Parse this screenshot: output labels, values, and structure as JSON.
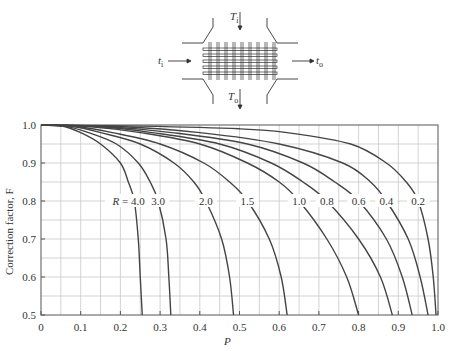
{
  "diagram": {
    "hot_in_label": "T",
    "hot_in_sub": "i",
    "hot_out_label": "T",
    "hot_out_sub": "o",
    "cold_in_label": "t",
    "cold_in_sub": "i",
    "cold_out_label": "t",
    "cold_out_sub": "o"
  },
  "chart_data": {
    "type": "line",
    "title": "",
    "xlabel": "P",
    "ylabel": "Correction factor, F",
    "xlim": [
      0,
      1.0
    ],
    "ylim": [
      0.5,
      1.0
    ],
    "x_ticks": [
      "0",
      "0.1",
      "0.2",
      "0.3",
      "0.4",
      "0.5",
      "0.6",
      "0.7",
      "0.8",
      "0.9",
      "1.0"
    ],
    "y_ticks": [
      "0.5",
      "0.6",
      "0.7",
      "0.8",
      "0.9",
      "1.0"
    ],
    "grid": true,
    "grid_step": 0.05,
    "label_row_F": 0.8,
    "label_prefix": "R = ",
    "series": [
      {
        "name": "4.0",
        "label_x": 0.235,
        "points": [
          [
            0,
            1.0
          ],
          [
            0.05,
            0.998
          ],
          [
            0.1,
            0.98
          ],
          [
            0.15,
            0.95
          ],
          [
            0.2,
            0.9
          ],
          [
            0.22,
            0.85
          ],
          [
            0.235,
            0.8
          ],
          [
            0.245,
            0.7
          ],
          [
            0.25,
            0.6
          ],
          [
            0.255,
            0.5
          ]
        ]
      },
      {
        "name": "3.0",
        "label_x": 0.295,
        "points": [
          [
            0,
            1.0
          ],
          [
            0.06,
            0.997
          ],
          [
            0.12,
            0.98
          ],
          [
            0.19,
            0.95
          ],
          [
            0.245,
            0.9
          ],
          [
            0.275,
            0.85
          ],
          [
            0.295,
            0.8
          ],
          [
            0.315,
            0.7
          ],
          [
            0.322,
            0.6
          ],
          [
            0.327,
            0.5
          ]
        ]
      },
      {
        "name": "2.0",
        "label_x": 0.415,
        "points": [
          [
            0,
            1.0
          ],
          [
            0.08,
            0.996
          ],
          [
            0.15,
            0.98
          ],
          [
            0.25,
            0.95
          ],
          [
            0.335,
            0.9
          ],
          [
            0.385,
            0.85
          ],
          [
            0.415,
            0.8
          ],
          [
            0.455,
            0.7
          ],
          [
            0.475,
            0.6
          ],
          [
            0.485,
            0.5
          ]
        ]
      },
      {
        "name": "1.5",
        "label_x": 0.52,
        "points": [
          [
            0,
            1.0
          ],
          [
            0.09,
            0.996
          ],
          [
            0.18,
            0.98
          ],
          [
            0.3,
            0.95
          ],
          [
            0.41,
            0.9
          ],
          [
            0.475,
            0.85
          ],
          [
            0.52,
            0.8
          ],
          [
            0.575,
            0.7
          ],
          [
            0.605,
            0.6
          ],
          [
            0.62,
            0.5
          ]
        ]
      },
      {
        "name": "1.0",
        "label_x": 0.65,
        "points": [
          [
            0,
            1.0
          ],
          [
            0.12,
            0.996
          ],
          [
            0.25,
            0.98
          ],
          [
            0.4,
            0.95
          ],
          [
            0.52,
            0.9
          ],
          [
            0.6,
            0.85
          ],
          [
            0.65,
            0.8
          ],
          [
            0.72,
            0.7
          ],
          [
            0.77,
            0.6
          ],
          [
            0.8,
            0.5
          ]
        ]
      },
      {
        "name": "0.8",
        "label_x": 0.72,
        "points": [
          [
            0,
            1.0
          ],
          [
            0.14,
            0.996
          ],
          [
            0.28,
            0.98
          ],
          [
            0.45,
            0.95
          ],
          [
            0.58,
            0.9
          ],
          [
            0.66,
            0.85
          ],
          [
            0.72,
            0.8
          ],
          [
            0.8,
            0.7
          ],
          [
            0.855,
            0.6
          ],
          [
            0.885,
            0.5
          ]
        ]
      },
      {
        "name": "0.6",
        "label_x": 0.8,
        "points": [
          [
            0,
            1.0
          ],
          [
            0.16,
            0.996
          ],
          [
            0.33,
            0.98
          ],
          [
            0.52,
            0.95
          ],
          [
            0.66,
            0.9
          ],
          [
            0.74,
            0.85
          ],
          [
            0.8,
            0.8
          ],
          [
            0.87,
            0.7
          ],
          [
            0.91,
            0.6
          ],
          [
            0.935,
            0.5
          ]
        ]
      },
      {
        "name": "0.4",
        "label_x": 0.87,
        "points": [
          [
            0,
            1.0
          ],
          [
            0.2,
            0.996
          ],
          [
            0.4,
            0.98
          ],
          [
            0.6,
            0.95
          ],
          [
            0.76,
            0.9
          ],
          [
            0.83,
            0.85
          ],
          [
            0.87,
            0.8
          ],
          [
            0.925,
            0.7
          ],
          [
            0.955,
            0.6
          ],
          [
            0.975,
            0.5
          ]
        ]
      },
      {
        "name": "0.2",
        "label_x": 0.95,
        "points": [
          [
            0,
            1.0
          ],
          [
            0.25,
            0.997
          ],
          [
            0.5,
            0.99
          ],
          [
            0.62,
            0.98
          ],
          [
            0.78,
            0.95
          ],
          [
            0.87,
            0.9
          ],
          [
            0.92,
            0.85
          ],
          [
            0.95,
            0.8
          ],
          [
            0.975,
            0.7
          ],
          [
            0.988,
            0.6
          ],
          [
            0.995,
            0.5
          ]
        ]
      }
    ]
  }
}
